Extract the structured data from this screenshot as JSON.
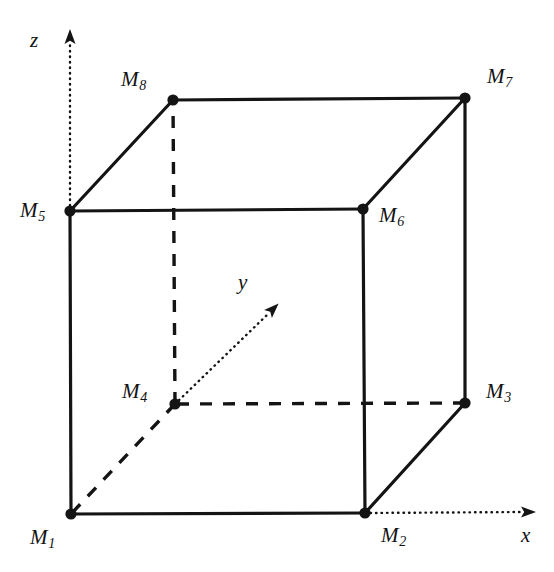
{
  "figure": {
    "background_color": "#ffffff",
    "stroke_color": "#141414",
    "vertex_marker_color": "#141414"
  },
  "axes": [
    {
      "id": "z",
      "label": "z",
      "label_x": 30,
      "label_y": 30,
      "from_x": 70,
      "from_y": 211,
      "to_x": 70,
      "to_y": 44,
      "arrow_x": 70,
      "arrow_y": 30,
      "style": "dotted"
    },
    {
      "id": "y",
      "label": "y",
      "label_x": 238,
      "label_y": 272,
      "from_x": 175,
      "from_y": 404,
      "to_x": 268,
      "to_y": 314,
      "arrow_x": 280,
      "arrow_y": 302,
      "style": "dotted"
    },
    {
      "id": "x",
      "label": "x",
      "label_x": 521,
      "label_y": 525,
      "from_x": 365,
      "from_y": 513,
      "to_x": 521,
      "to_y": 512,
      "arrow_x": 537,
      "arrow_y": 512,
      "style": "dotted"
    }
  ],
  "vertices": [
    {
      "id": "M1",
      "name": "M",
      "sub": "1",
      "x": 71,
      "y": 514,
      "label_x": 30,
      "label_y": 527
    },
    {
      "id": "M2",
      "name": "M",
      "sub": "2",
      "x": 365,
      "y": 513,
      "label_x": 381,
      "label_y": 525
    },
    {
      "id": "M3",
      "name": "M",
      "sub": "3",
      "x": 465,
      "y": 403,
      "label_x": 486,
      "label_y": 381
    },
    {
      "id": "M4",
      "name": "M",
      "sub": "4",
      "x": 175,
      "y": 404,
      "label_x": 122,
      "label_y": 381
    },
    {
      "id": "M5",
      "name": "M",
      "sub": "5",
      "x": 70,
      "y": 211,
      "label_x": 20,
      "label_y": 200
    },
    {
      "id": "M6",
      "name": "M",
      "sub": "6",
      "x": 363,
      "y": 209,
      "label_x": 379,
      "label_y": 205
    },
    {
      "id": "M7",
      "name": "M",
      "sub": "7",
      "x": 465,
      "y": 98,
      "label_x": 487,
      "label_y": 66
    },
    {
      "id": "M8",
      "name": "M",
      "sub": "8",
      "x": 173,
      "y": 100,
      "label_x": 121,
      "label_y": 69
    }
  ],
  "edges": [
    {
      "id": "M1-M2",
      "from": "M1",
      "to": "M2",
      "style": "solid"
    },
    {
      "id": "M2-M3",
      "from": "M2",
      "to": "M3",
      "style": "solid"
    },
    {
      "id": "M3-M4",
      "from": "M3",
      "to": "M4",
      "style": "dashed"
    },
    {
      "id": "M4-M1",
      "from": "M4",
      "to": "M1",
      "style": "dashed"
    },
    {
      "id": "M5-M6",
      "from": "M5",
      "to": "M6",
      "style": "solid"
    },
    {
      "id": "M6-M7",
      "from": "M6",
      "to": "M7",
      "style": "solid"
    },
    {
      "id": "M7-M8",
      "from": "M7",
      "to": "M8",
      "style": "solid"
    },
    {
      "id": "M8-M5",
      "from": "M8",
      "to": "M5",
      "style": "solid"
    },
    {
      "id": "M1-M5",
      "from": "M1",
      "to": "M5",
      "style": "solid"
    },
    {
      "id": "M2-M6",
      "from": "M2",
      "to": "M6",
      "style": "solid"
    },
    {
      "id": "M3-M7",
      "from": "M3",
      "to": "M7",
      "style": "solid"
    },
    {
      "id": "M4-M8",
      "from": "M4",
      "to": "M8",
      "style": "dashed"
    }
  ]
}
